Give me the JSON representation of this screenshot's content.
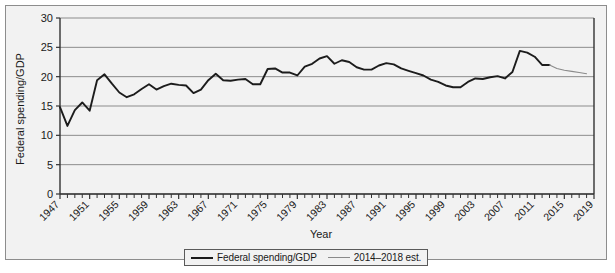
{
  "chart_data": {
    "type": "line",
    "title": "",
    "xlabel": "Year",
    "ylabel": "Federal spending/GDP",
    "xlim": [
      1947,
      2019
    ],
    "ylim": [
      0,
      30
    ],
    "ytick_step": 5,
    "yticks": [
      0,
      5,
      10,
      15,
      20,
      25,
      30
    ],
    "xticks": [
      1947,
      1951,
      1955,
      1959,
      1963,
      1967,
      1971,
      1975,
      1979,
      1983,
      1987,
      1991,
      1995,
      1999,
      2003,
      2007,
      2011,
      2015,
      2019
    ],
    "xtick_minor_step": 1,
    "grid": "horizontal",
    "legend_position": "bottom-center",
    "series": [
      {
        "name": "Federal spending/GDP",
        "color": "#1c1c1c",
        "width": 1.9,
        "x": [
          1947,
          1948,
          1949,
          1950,
          1951,
          1952,
          1953,
          1954,
          1955,
          1956,
          1957,
          1958,
          1959,
          1960,
          1961,
          1962,
          1963,
          1964,
          1965,
          1966,
          1967,
          1968,
          1969,
          1970,
          1971,
          1972,
          1973,
          1974,
          1975,
          1976,
          1977,
          1978,
          1979,
          1980,
          1981,
          1982,
          1983,
          1984,
          1985,
          1986,
          1987,
          1988,
          1989,
          1990,
          1991,
          1992,
          1993,
          1994,
          1995,
          1996,
          1997,
          1998,
          1999,
          2000,
          2001,
          2002,
          2003,
          2004,
          2005,
          2006,
          2007,
          2008,
          2009,
          2010,
          2011,
          2012,
          2013
        ],
        "values": [
          14.8,
          11.6,
          14.3,
          15.6,
          14.2,
          19.4,
          20.4,
          18.8,
          17.3,
          16.5,
          17.0,
          17.9,
          18.7,
          17.8,
          18.4,
          18.8,
          18.6,
          18.5,
          17.2,
          17.8,
          19.4,
          20.5,
          19.4,
          19.3,
          19.5,
          19.6,
          18.7,
          18.7,
          21.3,
          21.4,
          20.7,
          20.7,
          20.2,
          21.7,
          22.2,
          23.1,
          23.5,
          22.2,
          22.8,
          22.5,
          21.6,
          21.2,
          21.2,
          21.9,
          22.3,
          22.1,
          21.4,
          21.0,
          20.6,
          20.2,
          19.5,
          19.1,
          18.5,
          18.2,
          18.2,
          19.1,
          19.7,
          19.6,
          19.9,
          20.1,
          19.7,
          20.8,
          24.4,
          24.1,
          23.4,
          22.0,
          22.0
        ]
      },
      {
        "name": "2014–2018 est.",
        "color": "#8a8a8a",
        "width": 1.1,
        "x": [
          2013,
          2014,
          2015,
          2016,
          2017,
          2018
        ],
        "values": [
          22.0,
          21.4,
          21.1,
          20.9,
          20.7,
          20.5
        ]
      }
    ]
  },
  "legend": {
    "items": [
      {
        "label": "Federal spending/GDP",
        "style": "main"
      },
      {
        "label": "2014–2018 est.",
        "style": "est"
      }
    ]
  },
  "axes": {
    "y_title": "Federal spending/GDP",
    "x_title": "Year"
  }
}
